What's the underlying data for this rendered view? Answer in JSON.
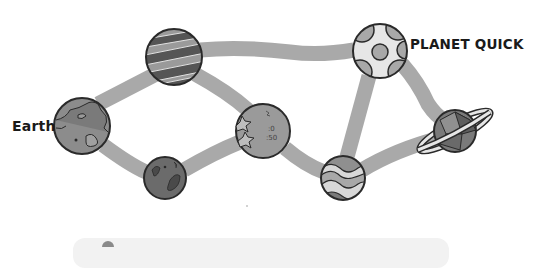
{
  "diagram": {
    "type": "planet-route-map",
    "labels": {
      "start": "Earth",
      "destination": "PLANET QUICK"
    },
    "colors": {
      "path": "#a9a9a9",
      "outline": "#2a2a2a",
      "planet_dark": "#6b6b6b",
      "planet_mid": "#8f8f8f",
      "planet_light": "#d8d8d8",
      "panel": "#f2f2f2"
    },
    "nodes": [
      {
        "id": "earth",
        "name": "Earth",
        "style": "continents",
        "x": 82,
        "y": 126,
        "r": 28
      },
      {
        "id": "striped",
        "name": "striped-planet",
        "style": "stripes",
        "x": 174,
        "y": 57,
        "r": 28
      },
      {
        "id": "dark",
        "name": "dark-spotted-planet",
        "style": "spots",
        "x": 165,
        "y": 178,
        "r": 21
      },
      {
        "id": "stars",
        "name": "cratered-star-planet",
        "style": "stars-craters",
        "x": 263,
        "y": 131,
        "r": 27
      },
      {
        "id": "swirl",
        "name": "swirl-planet",
        "style": "swirls",
        "x": 343,
        "y": 178,
        "r": 22
      },
      {
        "id": "quick",
        "name": "Planet Quick",
        "style": "circles",
        "x": 380,
        "y": 51,
        "r": 27
      },
      {
        "id": "ringed",
        "name": "ringed-planet",
        "style": "ring",
        "x": 455,
        "y": 131,
        "r": 21
      }
    ],
    "edges": [
      [
        "earth",
        "striped"
      ],
      [
        "earth",
        "dark"
      ],
      [
        "striped",
        "stars"
      ],
      [
        "dark",
        "stars"
      ],
      [
        "striped",
        "quick"
      ],
      [
        "stars",
        "swirl"
      ],
      [
        "swirl",
        "quick"
      ],
      [
        "swirl",
        "ringed"
      ],
      [
        "quick",
        "ringed"
      ]
    ]
  }
}
